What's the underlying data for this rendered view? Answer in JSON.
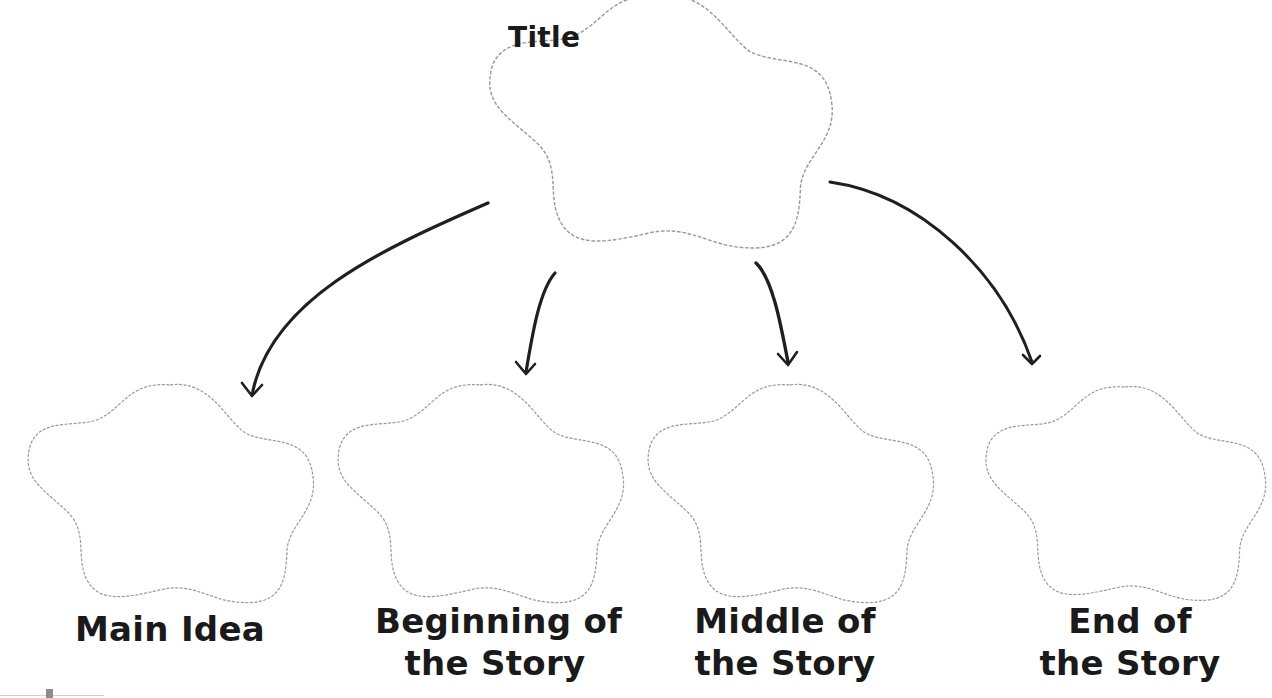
{
  "diagram": {
    "type": "story-map graphic organizer",
    "colors": {
      "shape_outline": "#9a9a9a",
      "arrow": "#1f1f1f",
      "text": "#1a1a1a",
      "background": "#ffffff"
    },
    "root": {
      "label": "Title",
      "shape": "flower-cloud"
    },
    "children": [
      {
        "line1": "Main Idea",
        "line2": "",
        "shape": "flower-cloud"
      },
      {
        "line1": "Beginning of",
        "line2": "the Story",
        "shape": "flower-cloud"
      },
      {
        "line1": "Middle of",
        "line2": "the Story",
        "shape": "flower-cloud"
      },
      {
        "line1": "End of",
        "line2": "the Story",
        "shape": "flower-cloud"
      }
    ],
    "edges": [
      {
        "from": "Title",
        "to": "Main Idea"
      },
      {
        "from": "Title",
        "to": "Beginning of the Story"
      },
      {
        "from": "Title",
        "to": "Middle of the Story"
      },
      {
        "from": "Title",
        "to": "End of the Story"
      }
    ]
  }
}
